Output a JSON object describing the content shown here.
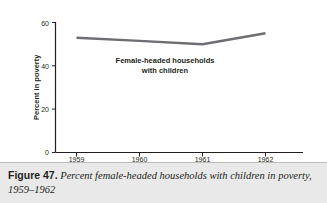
{
  "figure": {
    "caption_label": "Figure 47.",
    "caption_text": "Percent female-headed households with children in poverty, 1959–1962"
  },
  "chart_data": {
    "type": "line",
    "title": "",
    "subtitle": "",
    "xlabel": "",
    "ylabel": "Percent in poverty",
    "x": [
      "1959",
      "1960",
      "1961",
      "1962"
    ],
    "categories": [
      "1959",
      "1960",
      "1961",
      "1962"
    ],
    "series": [
      {
        "name": "Female-headed households with children",
        "values": [
          53,
          51.5,
          50,
          55
        ],
        "color": "#6d6e71"
      }
    ],
    "values": [
      53,
      51.5,
      50,
      55
    ],
    "annotations": [
      {
        "text_line1": "Female-headed households",
        "text_line2": "with children",
        "x": "1960",
        "y": 35
      }
    ],
    "ylim": [
      0,
      60
    ],
    "yticks": [
      0,
      20,
      40,
      60
    ],
    "ytick_labels": [
      "0",
      "20",
      "40",
      "60"
    ],
    "xtick_labels": [
      "1959",
      "1960",
      "1961",
      "1962"
    ],
    "grid": false,
    "legend": "none",
    "axis_color": "#231f20",
    "line_color": "#6d6e71",
    "background": "#ffffff"
  }
}
